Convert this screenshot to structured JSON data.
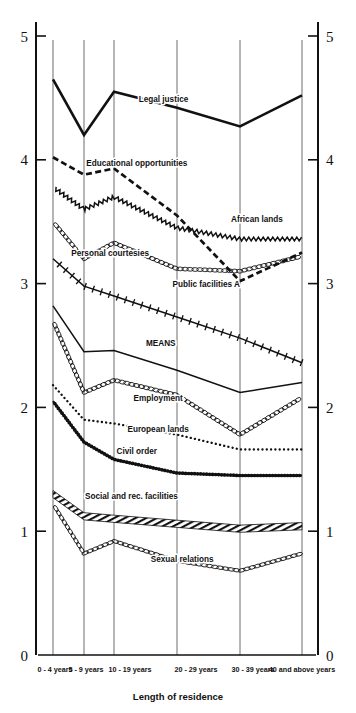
{
  "chart_data": {
    "type": "line",
    "title": "",
    "xlabel": "Length of residence",
    "ylabel": "",
    "ylim": [
      0,
      5
    ],
    "ytick_values": [
      0,
      1,
      2,
      3,
      4,
      5
    ],
    "ytick_labels_left": [
      "0",
      "1",
      "2",
      "3",
      "4",
      "5"
    ],
    "ytick_labels_right": [
      "0",
      "1",
      "2",
      "3",
      "4",
      "5"
    ],
    "grid": true,
    "grid_orientation": "vertical",
    "legend": "inline-labels",
    "axis_left_label_zero": "0",
    "axis_right_label_zero": "0",
    "categories": [
      "0 - 4 years",
      "5 - 9 years",
      "10 - 19 years",
      "20 - 29 years",
      "30 - 39 years",
      "40 and above years"
    ],
    "series": [
      {
        "name": "Legal justice",
        "style": "solid-thick",
        "label_x_frac": 0.47,
        "label_y_value": 4.47,
        "values": [
          4.65,
          4.2,
          4.55,
          4.42,
          4.27,
          4.52
        ]
      },
      {
        "name": "Educational opportunities",
        "style": "dashed",
        "label_x_frac": 0.37,
        "label_y_value": 3.95,
        "values": [
          4.02,
          3.88,
          3.93,
          3.55,
          3.02,
          3.25
        ]
      },
      {
        "name": "African lands",
        "style": "sawtooth",
        "label_x_frac": 0.82,
        "label_y_value": 3.5,
        "values": [
          3.78,
          3.6,
          3.7,
          3.45,
          3.36,
          3.36
        ]
      },
      {
        "name": "Personal courtesies",
        "style": "chain",
        "label_x_frac": 0.27,
        "label_y_value": 3.22,
        "values": [
          3.5,
          3.2,
          3.33,
          3.12,
          3.1,
          3.22
        ]
      },
      {
        "name": "Public facilities A",
        "style": "cross-hatch",
        "label_x_frac": 0.63,
        "label_y_value": 2.97,
        "values": [
          3.2,
          2.98,
          2.9,
          2.73,
          2.56,
          2.36
        ]
      },
      {
        "name": "MEANS",
        "style": "solid-thin",
        "label_x_frac": 0.46,
        "label_y_value": 2.5,
        "values": [
          2.82,
          2.45,
          2.46,
          2.3,
          2.12,
          2.2
        ]
      },
      {
        "name": "Employment",
        "style": "chain",
        "label_x_frac": 0.45,
        "label_y_value": 2.05,
        "values": [
          2.7,
          2.12,
          2.22,
          2.1,
          1.78,
          2.08
        ]
      },
      {
        "name": "European lands",
        "style": "dotted",
        "label_x_frac": 0.45,
        "label_y_value": 1.8,
        "values": [
          2.18,
          1.9,
          1.87,
          1.78,
          1.66,
          1.66
        ]
      },
      {
        "name": "Civil order",
        "style": "beaded",
        "label_x_frac": 0.37,
        "label_y_value": 1.62,
        "values": [
          2.05,
          1.72,
          1.58,
          1.47,
          1.45,
          1.45
        ]
      },
      {
        "name": "Social and rec. facilities",
        "style": "hatched-band",
        "label_x_frac": 0.35,
        "label_y_value": 1.26,
        "values": [
          1.3,
          1.12,
          1.1,
          1.06,
          1.02,
          1.04
        ]
      },
      {
        "name": "Sexual relations",
        "style": "oval-chain",
        "label_x_frac": 0.54,
        "label_y_value": 0.75,
        "values": [
          1.22,
          0.82,
          0.92,
          0.76,
          0.68,
          0.82
        ]
      }
    ]
  },
  "colors": {
    "ink": "#111111",
    "grid": "#6d6d6d",
    "background": "#ffffff"
  }
}
